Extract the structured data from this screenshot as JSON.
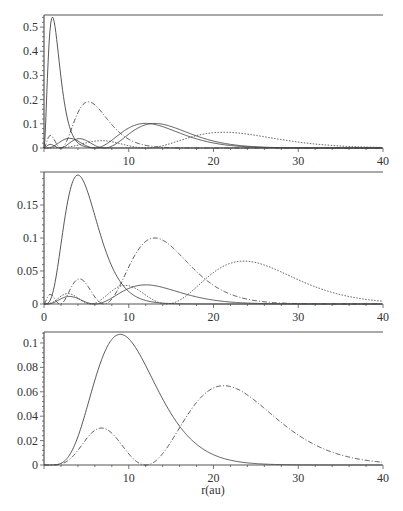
{
  "chart_data": [
    {
      "type": "line",
      "title": "",
      "xlabel": "",
      "ylabel": "",
      "xlim": [
        0,
        40
      ],
      "ylim": [
        0,
        0.55
      ],
      "x_ticks": [
        10,
        20,
        30,
        40
      ],
      "y_ticks": [
        0,
        0.1,
        0.2,
        0.3,
        0.4,
        0.5
      ],
      "y_tick_labels": [
        "0",
        "0.1",
        "0.2",
        "0.3",
        "0.4",
        "0.5"
      ],
      "grid": false,
      "series": [
        {
          "name": "n=1",
          "style": "solid",
          "peak_x": 1.0,
          "peak_y": 0.54
        },
        {
          "name": "n=2 (2s)",
          "style": "dashdot",
          "peaks": [
            [
              0.6,
              0.05
            ],
            [
              5.2,
              0.19
            ]
          ]
        },
        {
          "name": "n=2 (2p)",
          "style": "solid",
          "peak_x": 4.0,
          "peak_y": 0.04
        },
        {
          "name": "n=3",
          "style": "solid",
          "peak_x": 13.0,
          "peak_y": 0.1
        },
        {
          "name": "n=4",
          "style": "dotted",
          "peak_x": 25.0,
          "peak_y": 0.065
        }
      ]
    },
    {
      "type": "line",
      "title": "",
      "xlabel": "",
      "ylabel": "",
      "xlim": [
        0,
        40
      ],
      "ylim": [
        0,
        0.2
      ],
      "x_ticks": [
        0,
        10,
        20,
        30,
        40
      ],
      "y_ticks": [
        0,
        0.05,
        0.1,
        0.15
      ],
      "y_tick_labels": [
        "0",
        "0.05",
        "0.1",
        "0.15"
      ],
      "grid": false,
      "series": [
        {
          "name": "2p",
          "style": "solid",
          "peak_x": 4.0,
          "peak_y": 0.19
        },
        {
          "name": "3s-like",
          "style": "dashdot",
          "peaks": [
            [
              2.7,
              0.04
            ],
            [
              12.0,
              0.1
            ]
          ]
        },
        {
          "name": "3p",
          "style": "solid",
          "peaks": [
            [
              2.7,
              0.017
            ],
            [
              9.5,
              0.029
            ]
          ]
        },
        {
          "name": "4",
          "style": "dotted",
          "peak_x": 23.5,
          "peak_y": 0.065
        }
      ]
    },
    {
      "type": "line",
      "title": "",
      "xlabel": "r(au)",
      "ylabel": "",
      "xlim": [
        0,
        40
      ],
      "ylim": [
        0,
        0.109
      ],
      "x_ticks": [
        10,
        20,
        30,
        40
      ],
      "y_ticks": [
        0,
        0.02,
        0.04,
        0.06,
        0.08,
        0.1
      ],
      "y_tick_labels": [
        "0",
        "0.02",
        "0.04",
        "0.06",
        "0.08",
        "0.1"
      ],
      "grid": false,
      "series": [
        {
          "name": "3d",
          "style": "solid",
          "peak_x": 9.0,
          "peak_y": 0.106
        },
        {
          "name": "4d",
          "style": "dashdot",
          "peaks": [
            [
              6.8,
              0.031
            ],
            [
              21.2,
              0.065
            ]
          ]
        }
      ]
    }
  ],
  "panels": [
    {
      "x_tick_labels": [
        "10",
        "20",
        "30",
        "40"
      ]
    },
    {
      "x_tick_labels": [
        "0",
        "10",
        "20",
        "30",
        "40"
      ]
    },
    {
      "x_tick_labels": [
        "10",
        "20",
        "30",
        "40"
      ],
      "xlabel": "r(au)"
    }
  ],
  "colors": {
    "axis": "#555555",
    "line": "#444444",
    "text": "#333333"
  }
}
